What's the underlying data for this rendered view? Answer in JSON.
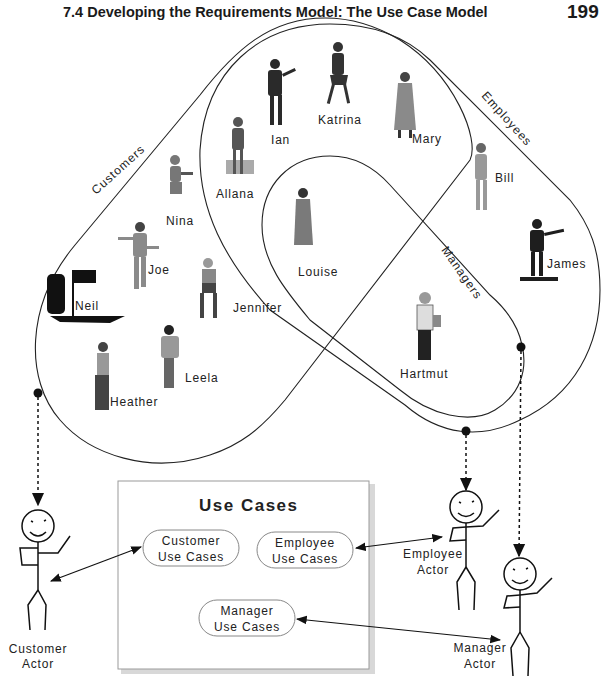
{
  "header": {
    "title": "7.4 Developing the Requirements Model: The Use Case Model",
    "page_number": "199"
  },
  "sets": {
    "customers": "Customers",
    "employees": "Employees",
    "managers": "Managers"
  },
  "people": {
    "ian": "Ian",
    "katrina": "Katrina",
    "mary": "Mary",
    "allana": "Allana",
    "nina": "Nina",
    "bill": "Bill",
    "louise": "Louise",
    "james": "James",
    "joe": "Joe",
    "neil": "Neil",
    "jennifer": "Jennifer",
    "hartmut": "Hartmut",
    "leela": "Leela",
    "heather": "Heather"
  },
  "use_cases": {
    "title": "Use Cases",
    "customer": [
      "Customer",
      "Use Cases"
    ],
    "employee": [
      "Employee",
      "Use Cases"
    ],
    "manager": [
      "Manager",
      "Use Cases"
    ]
  },
  "actors": {
    "customer": [
      "Customer",
      "Actor"
    ],
    "employee": [
      "Employee",
      "Actor"
    ],
    "manager": [
      "Manager",
      "Actor"
    ]
  },
  "colors": {
    "line": "#222222",
    "box_border": "#9a9a9a",
    "box_shadow": "#d0d0d0",
    "figure_dark": "#1e1e1e",
    "figure_gray": "#8a8a8a"
  }
}
